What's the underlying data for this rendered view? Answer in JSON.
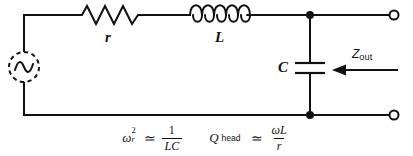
{
  "diagram": {
    "stroke_color": "#111111",
    "background_color": "#ffffff",
    "components": {
      "source": {
        "name": "ac-source",
        "symbol": "sine-wave-in-dashed-circle",
        "label": ""
      },
      "resistor": {
        "name": "resistor",
        "symbol": "zigzag",
        "label": "r"
      },
      "inductor": {
        "name": "inductor",
        "symbol": "coil",
        "coils": 5,
        "label": "L"
      },
      "capacitor": {
        "name": "capacitor",
        "symbol": "parallel-plates",
        "label": "C"
      },
      "terminals": {
        "top_label": "",
        "bottom_label": "",
        "style": "open-circle"
      },
      "nodes": {
        "style": "filled-dot",
        "count": 2
      }
    },
    "annotation": {
      "impedance_label": "Z",
      "impedance_sub": "out",
      "arrow_direction": "left"
    },
    "formulas": [
      {
        "name": "resonant-frequency",
        "lhs_base": "ω",
        "lhs_sup": "2",
        "lhs_sub": "r",
        "relation": "≃",
        "numerator": "1",
        "denominator": "LC",
        "plain": "ωr² ≃ 1/(LC)"
      },
      {
        "name": "quality-factor-head",
        "lhs_base": "Q",
        "lhs_sub_text": "head",
        "relation": "≃",
        "numerator": "ωL",
        "denominator": "r",
        "plain": "Q_head ≃ ωL/r"
      }
    ]
  }
}
